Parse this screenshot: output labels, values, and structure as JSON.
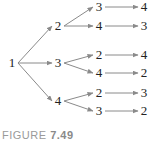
{
  "diagram": {
    "type": "tree",
    "root": {
      "id": "n1",
      "label": "1",
      "x": 12,
      "y": 67
    },
    "level1": [
      {
        "id": "n2",
        "label": "2",
        "x": 58,
        "y": 30
      },
      {
        "id": "n3",
        "label": "3",
        "x": 58,
        "y": 67
      },
      {
        "id": "n4",
        "label": "4",
        "x": 58,
        "y": 105
      }
    ],
    "level2": [
      {
        "id": "n2a",
        "parent": "n2",
        "label": "3",
        "x": 99,
        "y": 11
      },
      {
        "id": "n2b",
        "parent": "n2",
        "label": "4",
        "x": 99,
        "y": 30
      },
      {
        "id": "n3a",
        "parent": "n3",
        "label": "2",
        "x": 99,
        "y": 59
      },
      {
        "id": "n3b",
        "parent": "n3",
        "label": "4",
        "x": 99,
        "y": 77
      },
      {
        "id": "n4a",
        "parent": "n4",
        "label": "2",
        "x": 99,
        "y": 97
      },
      {
        "id": "n4b",
        "parent": "n4",
        "label": "3",
        "x": 99,
        "y": 115
      }
    ],
    "level3": [
      {
        "id": "n2a1",
        "parent": "n2a",
        "label": "4",
        "x": 144,
        "y": 11
      },
      {
        "id": "n2b1",
        "parent": "n2b",
        "label": "3",
        "x": 144,
        "y": 30
      },
      {
        "id": "n3a1",
        "parent": "n3a",
        "label": "4",
        "x": 144,
        "y": 59
      },
      {
        "id": "n3b1",
        "parent": "n3b",
        "label": "2",
        "x": 144,
        "y": 77
      },
      {
        "id": "n4a1",
        "parent": "n4a",
        "label": "3",
        "x": 144,
        "y": 97
      },
      {
        "id": "n4b1",
        "parent": "n4b",
        "label": "2",
        "x": 144,
        "y": 115
      }
    ],
    "edge_color": "#8a8a8a"
  },
  "caption": {
    "prefix": "FIGURE",
    "number": "7.49"
  }
}
